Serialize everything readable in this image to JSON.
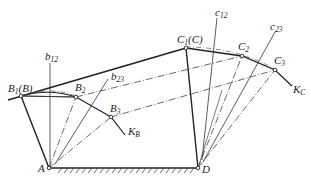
{
  "diagram": {
    "type": "four-bar linkage synthesis (three positions)",
    "points": {
      "A": {
        "label": "A",
        "x": 49,
        "y": 168
      },
      "D": {
        "label": "D",
        "x": 198,
        "y": 168
      },
      "B1": {
        "label": "B",
        "sub": "1",
        "suffix": "(B)",
        "x": 21,
        "y": 96
      },
      "B2": {
        "label": "B",
        "sub": "2",
        "x": 76,
        "y": 97
      },
      "B3": {
        "label": "B",
        "sub": "3",
        "x": 111,
        "y": 117
      },
      "C1": {
        "label": "C",
        "sub": "1",
        "suffix": "(C)",
        "x": 186,
        "y": 48
      },
      "C2": {
        "label": "C",
        "sub": "2",
        "x": 242,
        "y": 56
      },
      "C3": {
        "label": "C",
        "sub": "3",
        "x": 275,
        "y": 70
      }
    },
    "bisectors": {
      "b12": {
        "label": "b",
        "sub": "12"
      },
      "b23": {
        "label": "b",
        "sub": "23"
      },
      "c12": {
        "label": "c",
        "sub": "12"
      },
      "c23": {
        "label": "c",
        "sub": "23"
      }
    },
    "curves": {
      "KB": {
        "label": "K",
        "sub": "B"
      },
      "KC": {
        "label": "K",
        "sub": "C"
      }
    },
    "colors": {
      "line": "#222222",
      "background": "#ffffff"
    }
  }
}
